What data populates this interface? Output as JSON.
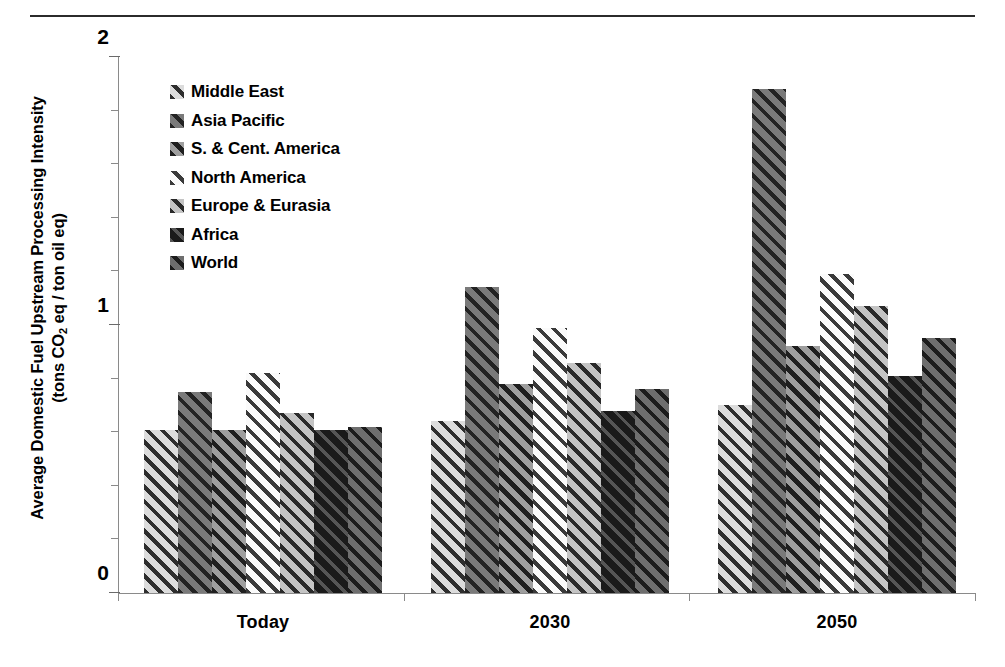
{
  "figure": {
    "y_axis_title_line1": "Average Domestic Fuel Upstream Processing Intensity",
    "y_axis_title_line2_pre": "(tons CO",
    "y_axis_title_line2_sub": "2",
    "y_axis_title_line2_post": " eq / ton oil eq)"
  },
  "legend": {
    "items": [
      {
        "label": "Middle East",
        "key": "middle-east",
        "pattern": "p-me"
      },
      {
        "label": "Asia Pacific",
        "key": "asia-pacific",
        "pattern": "p-ap"
      },
      {
        "label": "S. & Cent. America",
        "key": "s-and-cent-america",
        "pattern": "p-sca"
      },
      {
        "label": "North America",
        "key": "north-america",
        "pattern": "p-na"
      },
      {
        "label": "Europe & Eurasia",
        "key": "europe-and-eurasia",
        "pattern": "p-ee"
      },
      {
        "label": "Africa",
        "key": "africa",
        "pattern": "p-af"
      },
      {
        "label": "World",
        "key": "world",
        "pattern": "p-wd"
      }
    ]
  },
  "axis": {
    "y_tick_labels": [
      "0",
      "1",
      "2"
    ],
    "y_tick_values": [
      0,
      1,
      2
    ],
    "y_minor_step": 0.2,
    "x_tick_labels": [
      "Today",
      "2030",
      "2050"
    ]
  },
  "chart_data": {
    "type": "bar",
    "title": "",
    "subtitle": "",
    "xlabel": "",
    "ylabel": "Average Domestic Fuel Upstream Processing Intensity (tons CO2 eq / ton oil eq)",
    "categories": [
      "Today",
      "2030",
      "2050"
    ],
    "ylim": [
      0,
      2
    ],
    "yticks": [
      0,
      1,
      2
    ],
    "grid": false,
    "legend_position": "inside-upper-left",
    "series": [
      {
        "name": "Middle East",
        "values": [
          0.61,
          0.64,
          0.7
        ]
      },
      {
        "name": "Asia Pacific",
        "values": [
          0.75,
          1.14,
          1.88
        ]
      },
      {
        "name": "S. & Cent. America",
        "values": [
          0.61,
          0.78,
          0.92
        ]
      },
      {
        "name": "North America",
        "values": [
          0.82,
          0.99,
          1.19
        ]
      },
      {
        "name": "Europe & Eurasia",
        "values": [
          0.67,
          0.86,
          1.07
        ]
      },
      {
        "name": "Africa",
        "values": [
          0.61,
          0.68,
          0.81
        ]
      },
      {
        "name": "World",
        "values": [
          0.62,
          0.76,
          0.95
        ]
      }
    ]
  }
}
